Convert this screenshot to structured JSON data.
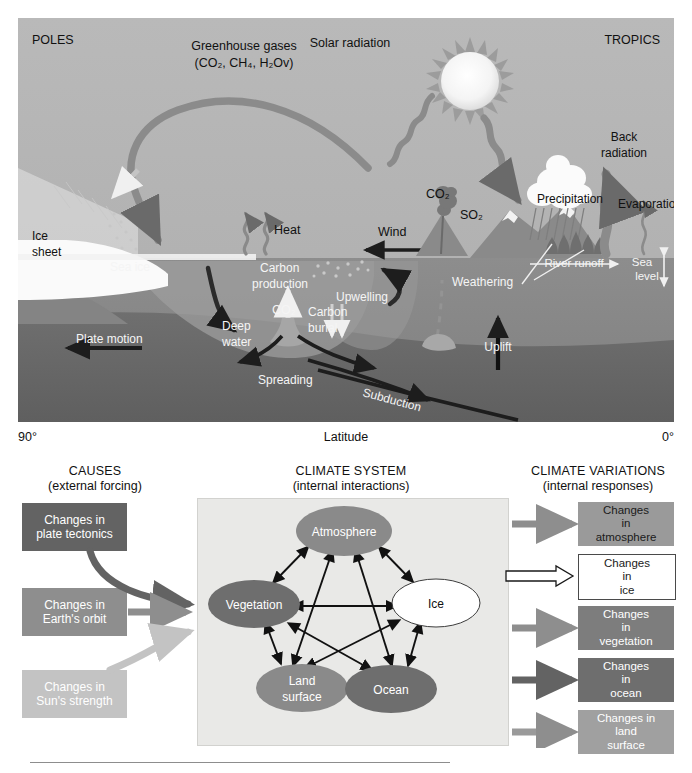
{
  "upper_diagram": {
    "corner_labels": {
      "left": "POLES",
      "right": "TROPICS"
    },
    "labels": {
      "greenhouse_line1": "Greenhouse gases",
      "greenhouse_line2": "(CO2, CH4, H2Ov)",
      "greenhouse_rich": "(CO₂, CH₄, H₂Ov)",
      "solar_radiation": "Solar radiation",
      "back_radiation_l1": "Back",
      "back_radiation_l2": "radiation",
      "precipitation": "Precipitation",
      "evaporation": "Evaporation",
      "river_runoff": "River runoff",
      "sea_level_l1": "Sea",
      "sea_level_l2": "level",
      "weathering": "Weathering",
      "heat": "Heat",
      "wind": "Wind",
      "ice_sheet_l1": "Ice",
      "ice_sheet_l2": "sheet",
      "sea_ice": "Sea ice",
      "carbon_production_l1": "Carbon",
      "carbon_production_l2": "production",
      "upwelling": "Upwelling",
      "co2_ocean": "CO₂",
      "co2_volcano": "CO₂",
      "so2_volcano": "SO₂",
      "carbon_burial_l1": "Carbon",
      "carbon_burial_l2": "burial",
      "deep_water_l1": "Deep",
      "deep_water_l2": "water",
      "plate_motion": "Plate motion",
      "spreading": "Spreading",
      "subduction": "Subduction",
      "uplift": "Uplift"
    },
    "axis": {
      "left_tick": "90°",
      "title": "Latitude",
      "right_tick": "0°"
    }
  },
  "lower_diagram": {
    "headings": [
      {
        "title": "CAUSES",
        "subtitle": "(external forcing)"
      },
      {
        "title": "CLIMATE SYSTEM",
        "subtitle": "(internal interactions)"
      },
      {
        "title": "CLIMATE VARIATIONS",
        "subtitle": "(internal responses)"
      }
    ],
    "causes": [
      {
        "l1": "Changes in",
        "l2": "plate tectonics",
        "color": "#636363",
        "arrow": "curved-dark"
      },
      {
        "l1": "Changes in",
        "l2": "Earth's orbit",
        "color": "#8e8e8e",
        "arrow": "straight-mid"
      },
      {
        "l1": "Changes in",
        "l2": "Sun's strength",
        "color": "#c3c3c3",
        "arrow": "curved-light"
      }
    ],
    "system_components": [
      {
        "label": "Atmosphere",
        "fill": "#8a8a8a",
        "text": "#ffffff"
      },
      {
        "label": "Vegetation",
        "fill": "#6e6e6e",
        "text": "#ffffff"
      },
      {
        "label": "Ice",
        "fill": "#ffffff",
        "text": "#111111"
      },
      {
        "label": "Land surface",
        "l1": "Land",
        "l2": "surface",
        "fill": "#8a8a8a",
        "text": "#ffffff"
      },
      {
        "label": "Ocean",
        "fill": "#6e6e6e",
        "text": "#ffffff"
      }
    ],
    "variations": [
      {
        "l1": "Changes",
        "l2": "in",
        "l3": "atmosphere",
        "color": "#9a9a9a",
        "arrow": "solid-gray"
      },
      {
        "l1": "Changes",
        "l2": "in",
        "l3": "ice",
        "color": "#ffffff",
        "arrow": "hollow"
      },
      {
        "l1": "Changes",
        "l2": "in",
        "l3": "vegetation",
        "color": "#7d7d7d",
        "arrow": "solid-gray"
      },
      {
        "l1": "Changes",
        "l2": "in",
        "l3": "ocean",
        "color": "#6e6e6e",
        "arrow": "solid-dark"
      },
      {
        "l1": "Changes in",
        "l2": "land",
        "l3": "surface",
        "color": "#a0a0a0",
        "arrow": "solid-gray"
      }
    ]
  },
  "colors": {
    "sky": "#b4b4b4",
    "ocean": "#8f8f8f",
    "deep_ocean": "#7a7a7a",
    "mantle": "#6d6d6d",
    "ice": "#fdfdfd",
    "accent_dark": "#2b2b2b"
  }
}
